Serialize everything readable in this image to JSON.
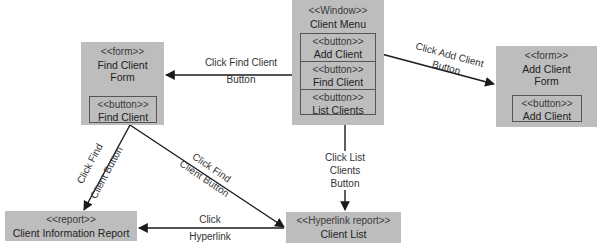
{
  "nodes": {
    "client_menu": {
      "stereotype": "<<Window>>",
      "title": "Client Menu",
      "buttons": [
        {
          "stereotype": "<<button>>",
          "label": "Add Client"
        },
        {
          "stereotype": "<<button>>",
          "label": "Find Client"
        },
        {
          "stereotype": "<<button>>",
          "label": "List Clients"
        }
      ]
    },
    "find_client_form": {
      "stereotype": "<<form>>",
      "title_line1": "Find Client",
      "title_line2": "Form",
      "button": {
        "stereotype": "<<button>>",
        "label": "Find Client"
      }
    },
    "add_client_form": {
      "stereotype": "<<form>>",
      "title_line1": "Add Client",
      "title_line2": "Form",
      "button": {
        "stereotype": "<<button>>",
        "label": "Add Client"
      }
    },
    "client_info_report": {
      "stereotype": "<<report>>",
      "title": "Client Information Report"
    },
    "client_list": {
      "stereotype": "<<Hyperlink report>>",
      "title": "Client List"
    }
  },
  "edges": {
    "menu_to_find": {
      "line1": "Click Find Client",
      "line2": "Button"
    },
    "menu_to_add": {
      "line1": "Click Add Client",
      "line2": "Button"
    },
    "menu_to_list": {
      "line1": "Click List",
      "line2": "Clients",
      "line3": "Button"
    },
    "find_to_report": {
      "line1": "Click Find",
      "line2": "Client Button"
    },
    "find_to_list": {
      "line1": "Click Find",
      "line2": "Client Button"
    },
    "list_to_report": {
      "line1": "Click",
      "line2": "Hyperlink"
    }
  },
  "colors": {
    "box_fill": "#bdbdbd",
    "line": "#1a1a1a",
    "background": "#ffffff"
  }
}
